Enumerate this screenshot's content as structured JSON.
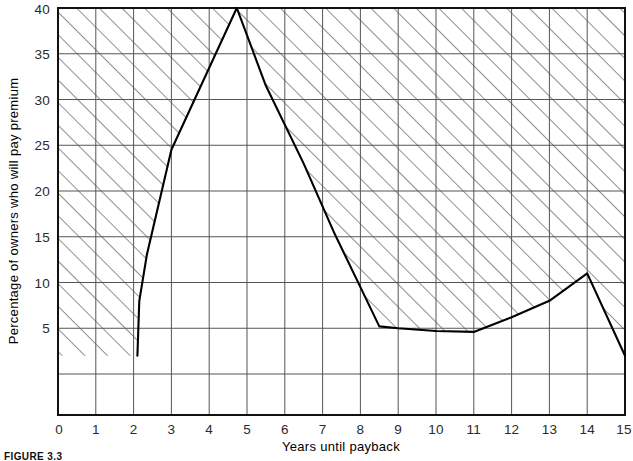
{
  "figure": {
    "caption": "FIGURE 3.3",
    "background_color": "#ffffff",
    "frame_color": "#111111",
    "grid_color": "#555555",
    "curve_color": "#000000",
    "hatch_color": "#333333"
  },
  "chart_data": {
    "type": "area",
    "title": "",
    "subtitle": "",
    "xlabel": "Years until payback",
    "ylabel": "Percentage of owners who will pay premium",
    "xlim": [
      0,
      15
    ],
    "ylim": [
      0,
      40
    ],
    "grid": true,
    "legend": null,
    "legend_position": "none",
    "x_ticks": [
      "0",
      "1",
      "2",
      "3",
      "4",
      "5",
      "6",
      "7",
      "8",
      "9",
      "10",
      "11",
      "12",
      "13",
      "14",
      "15"
    ],
    "y_ticks": [
      "5",
      "10",
      "15",
      "20",
      "25",
      "30",
      "35",
      "40"
    ],
    "x_tick_values": [
      0,
      1,
      2,
      3,
      4,
      5,
      6,
      7,
      8,
      9,
      10,
      11,
      12,
      13,
      14,
      15
    ],
    "y_tick_values": [
      5,
      10,
      15,
      20,
      25,
      30,
      35,
      40
    ],
    "y_gridline_values": [
      0,
      5,
      10,
      15,
      20,
      25,
      30,
      35,
      40
    ],
    "series": [
      {
        "name": "Percentage of owners who will pay premium",
        "fill": "hatched",
        "x": [
          2.1,
          2.15,
          2.35,
          3.0,
          4.73,
          5.5,
          6.5,
          7.3,
          8.0,
          8.5,
          9.0,
          10.0,
          11.0,
          12.0,
          13.0,
          14.0,
          15.0
        ],
        "values": [
          2.0,
          8.0,
          13.0,
          24.5,
          40.0,
          31.5,
          23.0,
          15.5,
          9.5,
          5.2,
          5.0,
          4.7,
          4.6,
          6.2,
          8.0,
          11.0,
          2.0
        ]
      }
    ],
    "annotations": []
  }
}
